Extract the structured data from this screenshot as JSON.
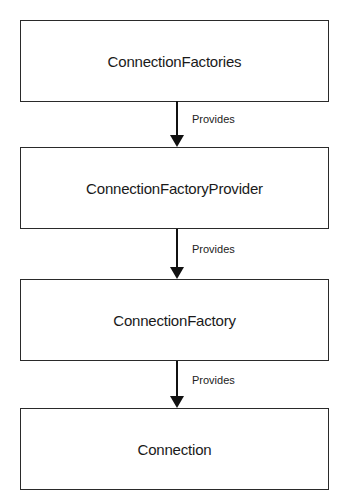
{
  "diagram": {
    "nodes": [
      {
        "id": "connection-factories",
        "label": "ConnectionFactories"
      },
      {
        "id": "connection-factory-provider",
        "label": "ConnectionFactoryProvider"
      },
      {
        "id": "connection-factory",
        "label": "ConnectionFactory"
      },
      {
        "id": "connection",
        "label": "Connection"
      }
    ],
    "edges": [
      {
        "from": "connection-factories",
        "to": "connection-factory-provider",
        "label": "Provides"
      },
      {
        "from": "connection-factory-provider",
        "to": "connection-factory",
        "label": "Provides"
      },
      {
        "from": "connection-factory",
        "to": "connection",
        "label": "Provides"
      }
    ],
    "colors": {
      "stroke": "#2a2a2a",
      "background": "#ffffff",
      "text": "#1a1a1a"
    }
  }
}
